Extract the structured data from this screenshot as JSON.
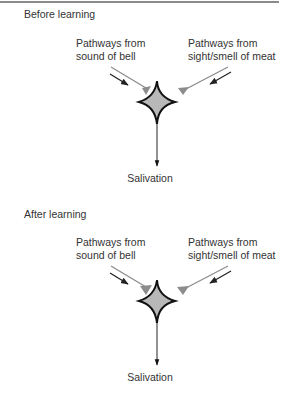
{
  "figure": {
    "panels": [
      {
        "title": "Before learning",
        "inputs": [
          {
            "label_line1": "Pathways from",
            "label_line2": "sound of bell",
            "synapse_strength": "weak"
          },
          {
            "label_line1": "Pathways from",
            "label_line2": "sight/smell of meat",
            "synapse_strength": "strong"
          }
        ],
        "output": "Salivation"
      },
      {
        "title": "After learning",
        "inputs": [
          {
            "label_line1": "Pathways from",
            "label_line2": "sound of bell",
            "synapse_strength": "strong"
          },
          {
            "label_line1": "Pathways from",
            "label_line2": "sight/smell of meat",
            "synapse_strength": "strong"
          }
        ],
        "output": "Salivation"
      }
    ],
    "colors": {
      "neuron_fill": "#b8b8b8",
      "neuron_stroke": "#111111",
      "pathway": "#8c8c8c",
      "synapse": "#8c8c8c",
      "arrow": "#222222"
    }
  }
}
